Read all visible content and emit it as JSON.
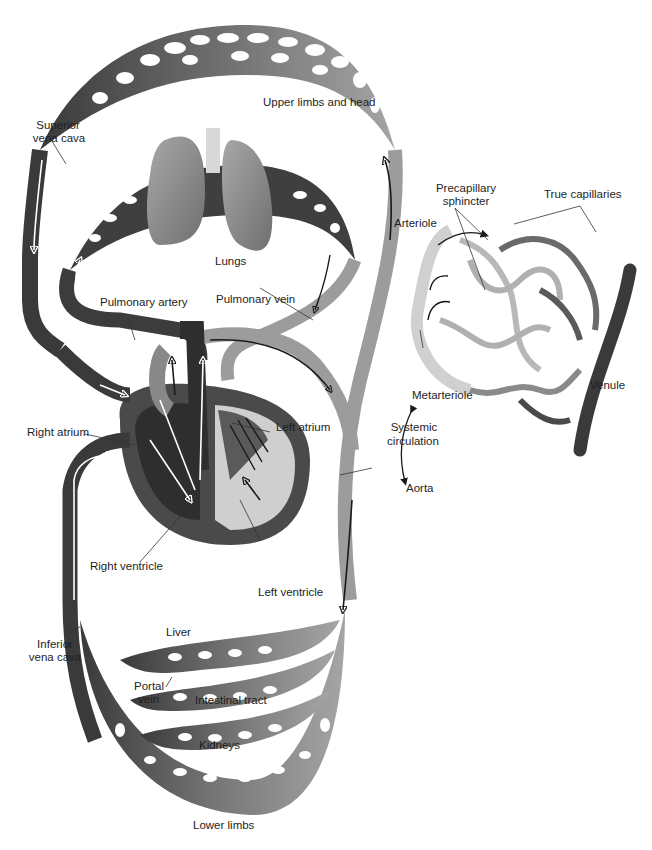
{
  "diagram": {
    "colors": {
      "vein_dark": "#3a3a3a",
      "artery_light": "#9a9a9a",
      "mid_gray": "#6e6e6e",
      "lung": "#8c8c8c",
      "heart_wall": "#4a4a4a",
      "background": "#ffffff",
      "label_text": "#1e1e1e"
    },
    "labels": {
      "upper_limbs": "Upper limbs and head",
      "superior_vena_cava_1": "Superior",
      "superior_vena_cava_2": "vena cava",
      "lungs": "Lungs",
      "pulmonary_artery": "Pulmonary artery",
      "pulmonary_vein": "Pulmonary vein",
      "right_atrium": "Right atrium",
      "left_atrium": "Left atrium",
      "right_ventricle": "Right ventricle",
      "left_ventricle": "Left ventricle",
      "aorta": "Aorta",
      "systemic_1": "Systemic",
      "systemic_2": "circulation",
      "inferior_vena_cava_1": "Inferior",
      "inferior_vena_cava_2": "vena cava",
      "liver": "Liver",
      "portal_vein_1": "Portal",
      "portal_vein_2": "vein",
      "intestinal_tract": "Intestinal tract",
      "kidneys": "Kidneys",
      "lower_limbs": "Lower limbs",
      "precapillary_1": "Precapillary",
      "precapillary_2": "sphincter",
      "true_capillaries": "True capillaries",
      "arteriole": "Arteriole",
      "metarteriole": "Metarteriole",
      "venule": "Venule"
    }
  }
}
